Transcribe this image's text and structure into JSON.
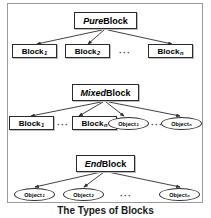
{
  "figure": {
    "caption": "The Types of Blocks",
    "border_color": "#9a9a9a",
    "node_border_color": "#2b2b2b",
    "background": "#ffffff"
  },
  "levels": [
    {
      "id": "pure",
      "parent": {
        "label_emphasis": "Pure",
        "label_rest": " Block",
        "shape": "rectangle"
      },
      "children": [
        {
          "label": "Block",
          "sub": "1",
          "shape": "rectangle"
        },
        {
          "label": "Block",
          "sub": "2",
          "shape": "rectangle"
        },
        {
          "label": "···",
          "shape": "ellipsis"
        },
        {
          "label": "Block",
          "sub": "n",
          "shape": "rectangle"
        }
      ]
    },
    {
      "id": "mixed",
      "parent": {
        "label_emphasis": "Mixed",
        "label_rest": " Block",
        "shape": "rectangle"
      },
      "children": [
        {
          "label": "Block",
          "sub": "1",
          "shape": "rectangle"
        },
        {
          "label": "···",
          "shape": "ellipsis"
        },
        {
          "label": "Block",
          "sub": "n",
          "shape": "rectangle"
        },
        {
          "label": "Object",
          "sub": "1",
          "shape": "ellipse"
        },
        {
          "label": "···",
          "shape": "ellipsis"
        },
        {
          "label": "Object",
          "sub": "n",
          "shape": "ellipse"
        }
      ]
    },
    {
      "id": "end",
      "parent": {
        "label_emphasis": "End",
        "label_rest": " Block",
        "shape": "rectangle"
      },
      "children": [
        {
          "label": "Object",
          "sub": "1",
          "shape": "ellipse"
        },
        {
          "label": "Object",
          "sub": "2",
          "shape": "ellipse"
        },
        {
          "label": "···",
          "shape": "ellipsis"
        },
        {
          "label": "Object",
          "sub": "n",
          "shape": "ellipse"
        }
      ]
    }
  ]
}
